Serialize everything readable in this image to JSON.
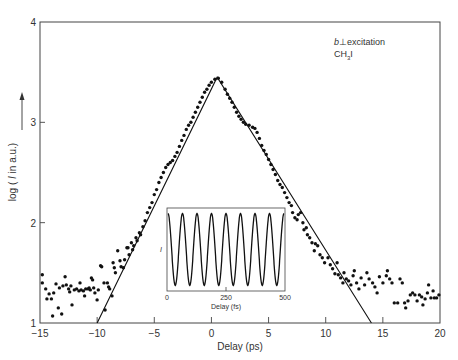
{
  "chart_data": {
    "type": "scatter",
    "title": "",
    "annotation": {
      "line1_prefix": "b",
      "line1_symbol": "⊥",
      "line1_suffix": "excitation",
      "line2_main": "CH",
      "line2_sub": "3",
      "line2_end": "I"
    },
    "xlabel": "Delay (ps)",
    "ylabel": "log ( I in a.u.)",
    "ylabel_arrow": "→",
    "xlim": [
      -15,
      20
    ],
    "ylim": [
      1,
      4
    ],
    "xticks": [
      -15,
      -10,
      -5,
      0,
      5,
      10,
      15,
      20
    ],
    "yticks": [
      1,
      2,
      3,
      4
    ],
    "grid": false,
    "legend": null,
    "series": [
      {
        "name": "measured data",
        "kind": "scatter",
        "points": [
          [
            -14.8,
            1.48
          ],
          [
            -14.8,
            1.4
          ],
          [
            -14.5,
            1.34
          ],
          [
            -14.4,
            1.24
          ],
          [
            -14.2,
            1.29
          ],
          [
            -14.0,
            1.24
          ],
          [
            -13.9,
            1.07
          ],
          [
            -13.8,
            1.3
          ],
          [
            -13.6,
            1.39
          ],
          [
            -13.4,
            1.15
          ],
          [
            -13.3,
            1.35
          ],
          [
            -13.1,
            1.09
          ],
          [
            -13.0,
            1.37
          ],
          [
            -12.8,
            1.46
          ],
          [
            -12.7,
            1.38
          ],
          [
            -12.5,
            1.34
          ],
          [
            -12.4,
            1.31
          ],
          [
            -12.3,
            1.37
          ],
          [
            -12.2,
            1.18
          ],
          [
            -12.0,
            1.33
          ],
          [
            -11.8,
            1.34
          ],
          [
            -11.6,
            1.32
          ],
          [
            -11.5,
            1.4
          ],
          [
            -11.4,
            1.33
          ],
          [
            -11.2,
            1.32
          ],
          [
            -11.1,
            1.27
          ],
          [
            -11.0,
            1.34
          ],
          [
            -10.8,
            1.34
          ],
          [
            -10.7,
            1.35
          ],
          [
            -10.6,
            1.33
          ],
          [
            -10.5,
            1.45
          ],
          [
            -10.4,
            1.43
          ],
          [
            -10.3,
            1.35
          ],
          [
            -10.2,
            1.3
          ],
          [
            -10.0,
            1.23
          ],
          [
            -9.9,
            1.33
          ],
          [
            -9.7,
            1.57
          ],
          [
            -9.6,
            1.56
          ],
          [
            -9.4,
            1.4
          ],
          [
            -9.3,
            1.13
          ],
          [
            -9.1,
            1.4
          ],
          [
            -9.0,
            1.36
          ],
          [
            -8.9,
            1.34
          ],
          [
            -8.7,
            1.27
          ],
          [
            -8.6,
            1.6
          ],
          [
            -8.5,
            1.55
          ],
          [
            -8.4,
            1.5
          ],
          [
            -8.2,
            1.72
          ],
          [
            -8.0,
            1.62
          ],
          [
            -7.9,
            1.56
          ],
          [
            -7.7,
            1.55
          ],
          [
            -7.6,
            1.63
          ],
          [
            -7.4,
            1.75
          ],
          [
            -7.3,
            1.75
          ],
          [
            -7.2,
            1.68
          ],
          [
            -7.0,
            1.8
          ],
          [
            -6.9,
            1.73
          ],
          [
            -6.8,
            1.77
          ],
          [
            -6.6,
            1.85
          ],
          [
            -6.5,
            1.82
          ],
          [
            -6.3,
            1.9
          ],
          [
            -6.2,
            1.88
          ],
          [
            -6.0,
            1.96
          ],
          [
            -5.8,
            2.02
          ],
          [
            -5.6,
            2.1
          ],
          [
            -5.4,
            2.15
          ],
          [
            -5.2,
            2.2
          ],
          [
            -5.0,
            2.28
          ],
          [
            -4.8,
            2.33
          ],
          [
            -4.6,
            2.4
          ],
          [
            -4.4,
            2.45
          ],
          [
            -4.2,
            2.5
          ],
          [
            -4.0,
            2.55
          ],
          [
            -3.8,
            2.58
          ],
          [
            -3.6,
            2.6
          ],
          [
            -3.4,
            2.62
          ],
          [
            -3.2,
            2.66
          ],
          [
            -3.0,
            2.7
          ],
          [
            -2.8,
            2.76
          ],
          [
            -2.6,
            2.82
          ],
          [
            -2.4,
            2.87
          ],
          [
            -2.2,
            2.93
          ],
          [
            -2.0,
            2.97
          ],
          [
            -1.8,
            3.0
          ],
          [
            -1.6,
            3.05
          ],
          [
            -1.4,
            3.1
          ],
          [
            -1.2,
            3.15
          ],
          [
            -1.0,
            3.2
          ],
          [
            -0.8,
            3.25
          ],
          [
            -0.6,
            3.3
          ],
          [
            -0.4,
            3.33
          ],
          [
            -0.2,
            3.37
          ],
          [
            0.0,
            3.4
          ],
          [
            0.3,
            3.43
          ],
          [
            0.6,
            3.44
          ],
          [
            0.9,
            3.4
          ],
          [
            1.2,
            3.33
          ],
          [
            1.4,
            3.28
          ],
          [
            1.6,
            3.24
          ],
          [
            1.8,
            3.2
          ],
          [
            2.0,
            3.15
          ],
          [
            2.2,
            3.1
          ],
          [
            2.4,
            3.06
          ],
          [
            2.6,
            3.03
          ],
          [
            2.8,
            3.0
          ],
          [
            3.0,
            2.98
          ],
          [
            3.3,
            2.97
          ],
          [
            3.6,
            2.95
          ],
          [
            3.8,
            2.94
          ],
          [
            4.0,
            2.9
          ],
          [
            4.2,
            2.84
          ],
          [
            4.4,
            2.77
          ],
          [
            4.6,
            2.72
          ],
          [
            4.8,
            2.68
          ],
          [
            5.0,
            2.63
          ],
          [
            5.2,
            2.58
          ],
          [
            5.4,
            2.53
          ],
          [
            5.6,
            2.48
          ],
          [
            5.8,
            2.42
          ],
          [
            6.0,
            2.38
          ],
          [
            6.2,
            2.35
          ],
          [
            6.4,
            2.3
          ],
          [
            6.6,
            2.25
          ],
          [
            6.8,
            2.2
          ],
          [
            7.0,
            2.17
          ],
          [
            7.1,
            2.1
          ],
          [
            7.3,
            2.05
          ],
          [
            7.5,
            2.03
          ],
          [
            7.6,
            2.08
          ],
          [
            7.8,
            2.1
          ],
          [
            8.0,
            2.0
          ],
          [
            8.1,
            1.93
          ],
          [
            8.3,
            1.95
          ],
          [
            8.4,
            1.88
          ],
          [
            8.6,
            1.85
          ],
          [
            8.8,
            1.8
          ],
          [
            9.0,
            1.72
          ],
          [
            9.1,
            1.79
          ],
          [
            9.3,
            1.77
          ],
          [
            9.5,
            1.68
          ],
          [
            9.7,
            1.65
          ],
          [
            9.9,
            1.6
          ],
          [
            10.2,
            1.65
          ],
          [
            10.4,
            1.58
          ],
          [
            10.6,
            1.54
          ],
          [
            10.8,
            1.49
          ],
          [
            11.0,
            1.6
          ],
          [
            11.1,
            1.48
          ],
          [
            11.3,
            1.45
          ],
          [
            11.5,
            1.4
          ],
          [
            11.6,
            1.5
          ],
          [
            11.8,
            1.44
          ],
          [
            12.0,
            1.42
          ],
          [
            12.2,
            1.38
          ],
          [
            12.4,
            1.47
          ],
          [
            12.5,
            1.52
          ],
          [
            12.7,
            1.4
          ],
          [
            12.9,
            1.34
          ],
          [
            13.1,
            1.45
          ],
          [
            13.4,
            1.38
          ],
          [
            13.6,
            1.5
          ],
          [
            13.8,
            1.44
          ],
          [
            14.1,
            1.4
          ],
          [
            14.3,
            1.36
          ],
          [
            14.5,
            1.3
          ],
          [
            14.7,
            1.46
          ],
          [
            15.0,
            1.4
          ],
          [
            15.3,
            1.47
          ],
          [
            15.4,
            1.52
          ],
          [
            15.6,
            1.44
          ],
          [
            15.8,
            1.4
          ],
          [
            16.0,
            1.2
          ],
          [
            16.3,
            1.2
          ],
          [
            16.5,
            1.44
          ],
          [
            16.7,
            1.4
          ],
          [
            16.9,
            1.2
          ],
          [
            17.0,
            1.15
          ],
          [
            17.2,
            1.22
          ],
          [
            17.4,
            1.28
          ],
          [
            17.6,
            1.3
          ],
          [
            17.8,
            1.28
          ],
          [
            18.0,
            1.22
          ],
          [
            18.2,
            1.28
          ],
          [
            18.4,
            1.26
          ],
          [
            18.5,
            1.18
          ],
          [
            18.7,
            1.24
          ],
          [
            18.9,
            1.3
          ],
          [
            19.0,
            1.38
          ],
          [
            19.2,
            1.25
          ],
          [
            19.4,
            1.32
          ],
          [
            19.5,
            1.25
          ],
          [
            19.7,
            1.25
          ],
          [
            19.9,
            1.28
          ]
        ]
      },
      {
        "name": "fit",
        "kind": "line",
        "points": [
          [
            -10.0,
            1.0
          ],
          [
            0.5,
            3.45
          ],
          [
            14.0,
            1.0
          ]
        ]
      }
    ],
    "inset": {
      "type": "line",
      "xlabel": "Delay (fs)",
      "ylabel": "I",
      "xticks": [
        0,
        250,
        500
      ],
      "xlim": [
        0,
        500
      ],
      "oscillations": 8,
      "description": "periodic oscillation, ~8 cycles over 500 fs (period ~62 fs)"
    }
  }
}
